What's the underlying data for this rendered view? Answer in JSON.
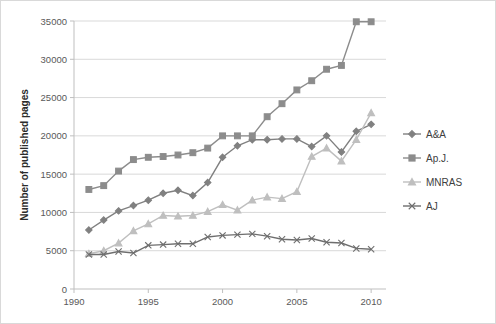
{
  "chart_data": {
    "type": "line",
    "title": "",
    "xlabel": "",
    "ylabel": "Number of published pages",
    "xlim": [
      1990,
      2011
    ],
    "ylim": [
      0,
      35000
    ],
    "grid": true,
    "legend_position": "right",
    "x_ticks": [
      "1990",
      "1995",
      "2000",
      "2005",
      "2010"
    ],
    "x_tick_values": [
      1990,
      1995,
      2000,
      2005,
      2010
    ],
    "y_ticks": [
      "0",
      "5000",
      "10000",
      "15000",
      "20000",
      "25000",
      "30000",
      "35000"
    ],
    "y_tick_values": [
      0,
      5000,
      10000,
      15000,
      20000,
      25000,
      30000,
      35000
    ],
    "x": [
      1991,
      1992,
      1993,
      1994,
      1995,
      1996,
      1997,
      1998,
      1999,
      2000,
      2001,
      2002,
      2003,
      2004,
      2005,
      2006,
      2007,
      2008,
      2009,
      2010
    ],
    "series": [
      {
        "name": "A&A",
        "marker": "diamond",
        "color": "#808080",
        "values": [
          7700,
          9000,
          10200,
          10900,
          11600,
          12500,
          12900,
          12200,
          13900,
          17200,
          18700,
          19500,
          19500,
          19600,
          19600,
          18600,
          20000,
          17900,
          20600,
          21500
        ]
      },
      {
        "name": "Ap.J.",
        "marker": "square",
        "color": "#8c8c8c",
        "values": [
          13000,
          13500,
          15400,
          16900,
          17200,
          17300,
          17500,
          17800,
          18400,
          20000,
          20000,
          20000,
          22500,
          24200,
          26000,
          27200,
          28700,
          29200,
          34900,
          34900
        ]
      },
      {
        "name": "MNRAS",
        "marker": "triangle",
        "color": "#bfbfbf",
        "values": [
          4600,
          5000,
          6000,
          7600,
          8500,
          9600,
          9500,
          9600,
          10100,
          11000,
          10300,
          11600,
          12000,
          11800,
          12700,
          17300,
          18400,
          16700,
          19500,
          23000
        ]
      },
      {
        "name": "AJ",
        "marker": "x",
        "color": "#6e6e6e",
        "values": [
          4500,
          4500,
          4900,
          4700,
          5700,
          5800,
          5900,
          5900,
          6800,
          7000,
          7100,
          7200,
          6900,
          6500,
          6400,
          6600,
          6100,
          6000,
          5300,
          5200
        ]
      }
    ]
  },
  "legend": {
    "items": [
      {
        "label": "A&A"
      },
      {
        "label": "Ap.J."
      },
      {
        "label": "MNRAS"
      },
      {
        "label": "AJ"
      }
    ]
  }
}
